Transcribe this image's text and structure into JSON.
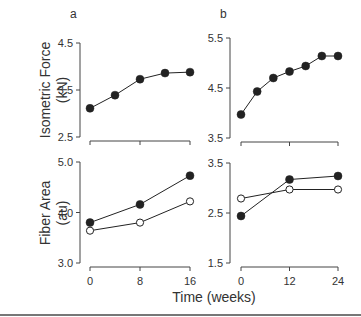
{
  "figure": {
    "xlabel": "Time (weeks)",
    "bottom_rule": true
  },
  "chart_data": [
    {
      "id": "a-top",
      "panel_label": "a",
      "type": "line",
      "ylabel": [
        "Isometric Force",
        "(kN)"
      ],
      "xlabel": "Time (weeks)",
      "ylim": [
        2.5,
        4.5
      ],
      "yticks": [
        "2.5",
        "3.5",
        "4.5"
      ],
      "xlim": [
        0,
        16
      ],
      "xticks": [
        "0",
        "8",
        "16"
      ],
      "x_tick_labels_shown": false,
      "series": [
        {
          "name": "filled",
          "marker": "filled-circle",
          "x": [
            0,
            4,
            8,
            12,
            16
          ],
          "values": [
            3.11,
            3.39,
            3.73,
            3.86,
            3.88
          ]
        }
      ]
    },
    {
      "id": "b-top",
      "panel_label": "b",
      "type": "line",
      "ylabel": [
        "Isometric Force",
        "(kN)"
      ],
      "xlabel": "Time (weeks)",
      "ylim": [
        3.5,
        5.5
      ],
      "yticks": [
        "3.5",
        "4.5",
        "5.5"
      ],
      "xlim": [
        0,
        24
      ],
      "xticks": [
        "0",
        "12",
        "24"
      ],
      "x_tick_labels_shown": false,
      "series": [
        {
          "name": "filled",
          "marker": "filled-circle",
          "x": [
            0,
            4,
            8,
            12,
            16,
            20,
            24
          ],
          "values": [
            3.97,
            4.43,
            4.7,
            4.83,
            4.94,
            5.14,
            5.14
          ]
        }
      ]
    },
    {
      "id": "a-bottom",
      "panel_label": "",
      "type": "line",
      "ylabel": [
        "Fiber Area",
        "(au)"
      ],
      "xlabel": "Time (weeks)",
      "ylim": [
        3.0,
        5.0
      ],
      "yticks": [
        "3.0",
        "4.0",
        "5.0"
      ],
      "xlim": [
        0,
        16
      ],
      "xticks": [
        "0",
        "8",
        "16"
      ],
      "x_tick_labels_shown": true,
      "series": [
        {
          "name": "filled",
          "marker": "filled-circle",
          "x": [
            0,
            8,
            16
          ],
          "values": [
            3.8,
            4.16,
            4.73
          ]
        },
        {
          "name": "open",
          "marker": "open-circle",
          "x": [
            0,
            8,
            16
          ],
          "values": [
            3.64,
            3.8,
            4.22
          ]
        }
      ]
    },
    {
      "id": "b-bottom",
      "panel_label": "",
      "type": "line",
      "ylabel": [
        "Fiber Area",
        "(au)"
      ],
      "xlabel": "Time (weeks)",
      "ylim": [
        1.5,
        3.5
      ],
      "yticks": [
        "1.5",
        "2.5",
        "3.5"
      ],
      "xlim": [
        0,
        24
      ],
      "xticks": [
        "0",
        "12",
        "24"
      ],
      "x_tick_labels_shown": true,
      "series": [
        {
          "name": "filled",
          "marker": "filled-circle",
          "x": [
            0,
            12,
            24
          ],
          "values": [
            2.44,
            3.17,
            3.24
          ]
        },
        {
          "name": "open",
          "marker": "open-circle",
          "x": [
            0,
            12,
            24
          ],
          "values": [
            2.79,
            2.97,
            2.97
          ]
        }
      ]
    }
  ]
}
